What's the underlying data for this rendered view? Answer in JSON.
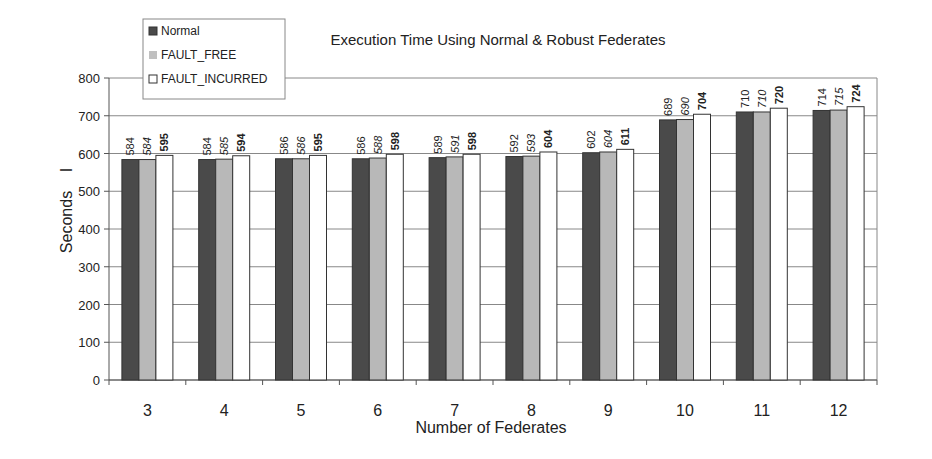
{
  "chart_data": {
    "type": "bar",
    "title": "Execution Time Using Normal & Robust Federates",
    "xlabel": "Number of Federates",
    "ylabel": "Seconds",
    "ylim": [
      0,
      800
    ],
    "yticks": [
      0,
      100,
      200,
      300,
      400,
      500,
      600,
      700,
      800
    ],
    "grid": true,
    "legend_position": "top-left",
    "categories": [
      "3",
      "4",
      "5",
      "6",
      "7",
      "8",
      "9",
      "10",
      "11",
      "12"
    ],
    "series": [
      {
        "name": "Normal",
        "color": "#4a4a4a",
        "values": [
          584,
          584,
          586,
          586,
          589,
          592,
          602,
          689,
          710,
          714
        ]
      },
      {
        "name": "FAULT_FREE",
        "color": "#b8b8b8",
        "values": [
          584,
          585,
          586,
          588,
          591,
          593,
          604,
          690,
          710,
          715
        ]
      },
      {
        "name": "FAULT_INCURRED",
        "color": "#ffffff",
        "values": [
          595,
          594,
          595,
          598,
          598,
          604,
          611,
          704,
          720,
          724
        ]
      }
    ]
  },
  "legend": {
    "items": [
      {
        "label": "Normal",
        "icon": "dark-square-icon"
      },
      {
        "label": "FAULT_FREE",
        "icon": "gray-square-icon"
      },
      {
        "label": "FAULT_INCURRED",
        "icon": "white-square-icon"
      }
    ]
  },
  "labels": {
    "title": "Execution Time Using Normal & Robust Federates",
    "xlabel": "Number of Federates",
    "ylabel": "Seconds",
    "ylabel_mark": "I"
  }
}
